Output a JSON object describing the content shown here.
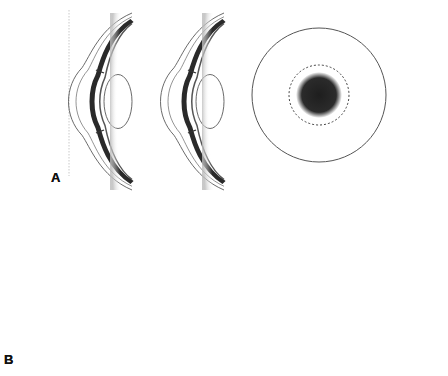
{
  "figure": {
    "panels": [
      {
        "label": "A",
        "description": "Two sagittal eye cross-sections with cornea touching a vertical reference line; retinal image shows a central filled blur disc within a dashed circle",
        "eyes": 2,
        "retinal_pattern": "filled-disc"
      },
      {
        "label": "B",
        "description": "Three sagittal eye cross-sections with a reshaped (flattened) central cornea and an eyelid with curved arrow; retinal image shows an annular ring blur",
        "eyes": 3,
        "retinal_pattern": "ring"
      }
    ],
    "colors": {
      "line": "#444444",
      "dark_tissue": "#2a2a2a",
      "blur": "#222222",
      "background": "#ffffff"
    }
  }
}
